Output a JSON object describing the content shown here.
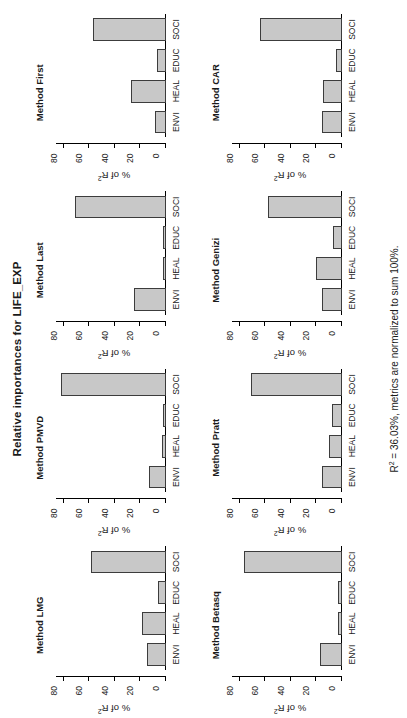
{
  "figure": {
    "title": "Relative importances for LIFE_EXP",
    "footnote_prefix": "R",
    "footnote_sup": "2",
    "footnote_rest": " = 36.03%, metrics are normalized to sum 100%.",
    "r_squared_percent": "36.03%",
    "y_axis_title_prefix": "% of R",
    "y_axis_title_sup": "2",
    "bar_fill_color": "#c8c8c8",
    "bar_border_color": "#3c3c3c",
    "background_color": "#ffffff",
    "text_color": "#1a1a1a"
  },
  "axis": {
    "ticks": [
      "0",
      "20",
      "40",
      "60",
      "80"
    ],
    "tick_values": [
      0,
      20,
      40,
      60,
      80
    ],
    "ymin": 0,
    "ymax": 86
  },
  "chart_data": {
    "type": "bar",
    "title": "Relative importances for LIFE_EXP",
    "xlabel": "",
    "ylabel": "% of R2",
    "ylim": [
      0,
      86
    ],
    "grid": false,
    "legend": "none",
    "categories": [
      "ENVI",
      "HEAL",
      "EDUC",
      "SOCI"
    ],
    "annotation": "R2 = 36.03%, metrics are normalized to sum 100%.",
    "panels": [
      {
        "id": "lmg",
        "title": "Method LMG",
        "values": [
          15,
          19,
          6,
          59
        ]
      },
      {
        "id": "pmvd",
        "title": "Method PMVD",
        "values": [
          13,
          3,
          2,
          82
        ]
      },
      {
        "id": "last",
        "title": "Method Last",
        "values": [
          25,
          2,
          2,
          71
        ]
      },
      {
        "id": "first",
        "title": "Method First",
        "values": [
          9,
          27,
          7,
          57
        ]
      },
      {
        "id": "betasq",
        "title": "Method Betasq",
        "values": [
          17,
          3,
          3,
          77
        ]
      },
      {
        "id": "pratt",
        "title": "Method Pratt",
        "values": [
          16,
          10,
          8,
          71
        ]
      },
      {
        "id": "genizi",
        "title": "Method Genizi",
        "values": [
          16,
          20,
          7,
          58
        ]
      },
      {
        "id": "car",
        "title": "Method CAR",
        "values": [
          16,
          15,
          5,
          64
        ]
      }
    ]
  }
}
